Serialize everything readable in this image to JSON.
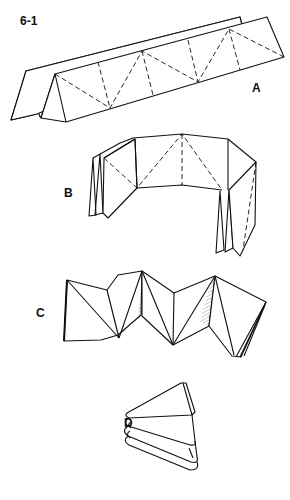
{
  "figure": {
    "number": "6-1",
    "panels": [
      {
        "label": "A",
        "description": "Accordion-folded paper strip laid flat with dashed diagonal crease lines"
      },
      {
        "label": "B",
        "description": "Strip bent into an open curve with pleated ends"
      },
      {
        "label": "C",
        "description": "Strip collapsed into a zigzag of triangular folds"
      },
      {
        "label": "D",
        "description": "Fully collapsed stacked triangular fold"
      }
    ]
  }
}
